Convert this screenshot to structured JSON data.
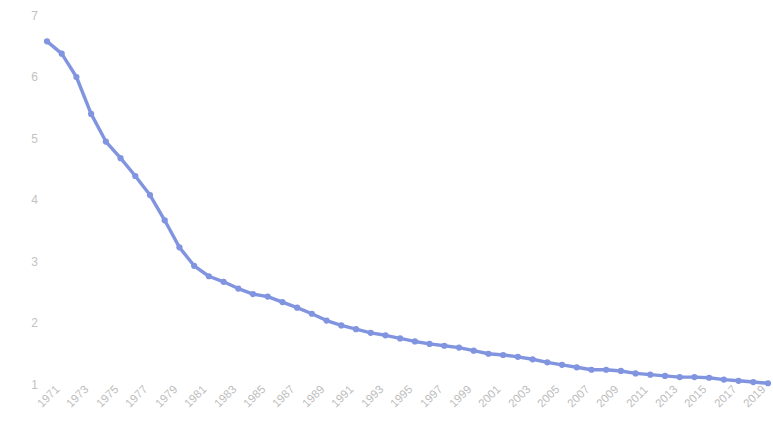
{
  "chart_data": {
    "type": "line",
    "title": "",
    "xlabel": "",
    "ylabel": "Purchasing power of one U.S. dollar",
    "xlim": [
      1971,
      2020
    ],
    "ylim": [
      0.72,
      7.25
    ],
    "grid": false,
    "legend": null,
    "line_color": "#8094E0",
    "marker": "circle",
    "x": [
      1971,
      1972,
      1973,
      1974,
      1975,
      1976,
      1977,
      1978,
      1979,
      1980,
      1981,
      1982,
      1983,
      1984,
      1985,
      1986,
      1987,
      1988,
      1989,
      1990,
      1991,
      1992,
      1993,
      1994,
      1995,
      1996,
      1997,
      1998,
      1999,
      2000,
      2001,
      2002,
      2003,
      2004,
      2005,
      2006,
      2007,
      2008,
      2009,
      2010,
      2011,
      2012,
      2013,
      2014,
      2015,
      2016,
      2017,
      2018,
      2019,
      2020
    ],
    "values": [
      6.58,
      6.38,
      6.0,
      5.4,
      4.95,
      4.68,
      4.39,
      4.08,
      3.67,
      3.23,
      2.93,
      2.76,
      2.67,
      2.56,
      2.47,
      2.43,
      2.34,
      2.25,
      2.15,
      2.04,
      1.96,
      1.9,
      1.84,
      1.8,
      1.75,
      1.7,
      1.66,
      1.63,
      1.6,
      1.55,
      1.5,
      1.48,
      1.45,
      1.41,
      1.36,
      1.32,
      1.28,
      1.24,
      1.24,
      1.22,
      1.18,
      1.16,
      1.14,
      1.12,
      1.12,
      1.11,
      1.08,
      1.06,
      1.04,
      1.02
    ],
    "ytick_labels": [
      "7",
      "6",
      "5",
      "4",
      "3",
      "2",
      "1"
    ],
    "ytick_values": [
      7,
      6,
      5,
      4,
      3,
      2,
      1
    ],
    "xtick_labels": [
      "1971",
      "1973",
      "1975",
      "1977",
      "1979",
      "1981",
      "1983",
      "1985",
      "1987",
      "1989",
      "1991",
      "1993",
      "1995",
      "1997",
      "1999",
      "2001",
      "2003",
      "2005",
      "2007",
      "2009",
      "2011",
      "2013",
      "2015",
      "2017",
      "2019"
    ],
    "xtick_values": [
      1971,
      1973,
      1975,
      1977,
      1979,
      1981,
      1983,
      1985,
      1987,
      1989,
      1991,
      1993,
      1995,
      1997,
      1999,
      2001,
      2003,
      2005,
      2007,
      2009,
      2011,
      2013,
      2015,
      2017,
      2019
    ]
  }
}
